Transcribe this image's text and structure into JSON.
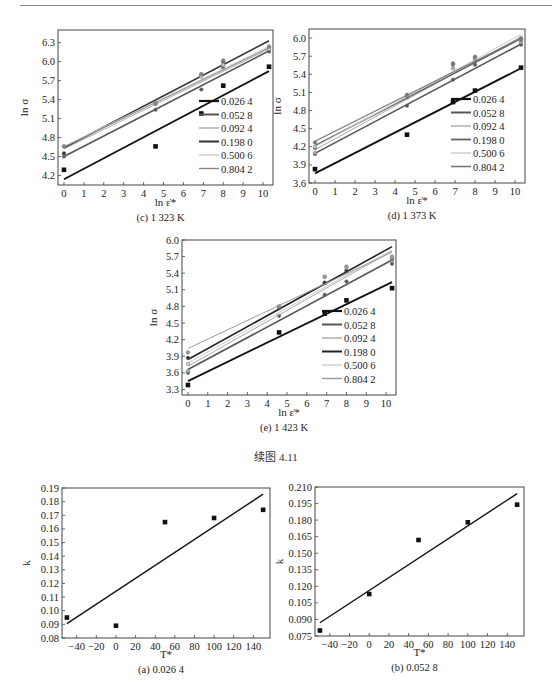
{
  "page": {
    "figure_caption": "续图 4.11"
  },
  "chart_data": [
    {
      "id": "c",
      "type": "scatter",
      "caption": "(c) 1 323 K",
      "xlabel": "ln ε̇*",
      "ylabel": "ln σ",
      "xlim": [
        -0.3,
        10.5
      ],
      "ylim": [
        4.05,
        6.5
      ],
      "xticks": [
        0,
        1,
        2,
        3,
        4,
        5,
        6,
        7,
        8,
        9,
        10
      ],
      "yticks": [
        4.2,
        4.5,
        4.8,
        5.1,
        5.4,
        5.7,
        6.0,
        6.3
      ],
      "ytick_labels": [
        "4.2",
        "4.5",
        "4.8",
        "5.1",
        "5.4",
        "5.7",
        "6.0",
        "6.3"
      ],
      "legend_position": "bottom-right",
      "x": [
        0,
        4.6,
        6.9,
        8.0,
        10.3
      ],
      "series": [
        {
          "name": "0.026 4",
          "color": "#111111",
          "width": 1.8,
          "values": [
            4.29,
            4.66,
            5.18,
            5.62,
            5.92
          ],
          "fit": [
            4.14,
            5.85
          ]
        },
        {
          "name": "0.052 8",
          "color": "#555555",
          "width": 1.6,
          "values": [
            4.5,
            5.24,
            5.56,
            5.9,
            6.16
          ],
          "fit": [
            4.5,
            6.17
          ]
        },
        {
          "name": "0.092 4",
          "color": "#aaaaaa",
          "width": 1.0,
          "values": [
            4.54,
            5.33,
            5.78,
            5.95,
            6.2
          ],
          "fit": [
            4.62,
            6.2
          ]
        },
        {
          "name": "0.198 0",
          "color": "#333333",
          "width": 1.6,
          "values": [
            4.55,
            5.34,
            5.8,
            6.0,
            6.22
          ],
          "fit": [
            4.64,
            6.33
          ]
        },
        {
          "name": "0.500 6",
          "color": "#cccccc",
          "width": 1.0,
          "values": [
            4.66,
            5.35,
            5.76,
            5.95,
            6.2
          ],
          "fit": [
            4.66,
            6.24
          ]
        },
        {
          "name": "0.804 2",
          "color": "#888888",
          "width": 1.0,
          "values": [
            4.66,
            5.34,
            5.8,
            6.02,
            6.24
          ],
          "fit": [
            4.65,
            6.22
          ]
        }
      ]
    },
    {
      "id": "d",
      "type": "scatter",
      "caption": "(d) 1 373 K",
      "xlabel": "ln ε̇*",
      "ylabel": "ln σ",
      "xlim": [
        -0.3,
        10.5
      ],
      "ylim": [
        3.6,
        6.15
      ],
      "xticks": [
        0,
        1,
        2,
        3,
        4,
        5,
        6,
        7,
        8,
        9,
        10
      ],
      "yticks": [
        3.6,
        3.9,
        4.2,
        4.5,
        4.8,
        5.1,
        5.4,
        5.7,
        6.0
      ],
      "ytick_labels": [
        "3.6",
        "3.9",
        "4.2",
        "4.5",
        "4.8",
        "5.1",
        "5.4",
        "5.7",
        "6.0"
      ],
      "legend_position": "bottom-right",
      "x": [
        0,
        4.6,
        6.9,
        8.0,
        10.3
      ],
      "series": [
        {
          "name": "0.026 4",
          "color": "#111111",
          "width": 1.8,
          "values": [
            3.83,
            4.4,
            4.94,
            5.13,
            5.51
          ],
          "fit": [
            3.76,
            5.5
          ]
        },
        {
          "name": "0.052 8",
          "color": "#555555",
          "width": 1.6,
          "values": [
            4.08,
            4.88,
            5.31,
            5.56,
            5.89
          ],
          "fit": [
            4.09,
            5.9
          ]
        },
        {
          "name": "0.092 4",
          "color": "#aaaaaa",
          "width": 1.0,
          "values": [
            4.1,
            5.02,
            5.5,
            5.62,
            5.93
          ],
          "fit": [
            4.15,
            6.02
          ]
        },
        {
          "name": "0.198 0",
          "color": "#666666",
          "width": 1.4,
          "values": [
            4.18,
            5.03,
            5.56,
            5.66,
            5.97
          ],
          "fit": [
            4.22,
            5.99
          ]
        },
        {
          "name": "0.500 6",
          "color": "#cccccc",
          "width": 1.0,
          "values": [
            4.2,
            5.05,
            5.57,
            5.68,
            6.0
          ],
          "fit": [
            4.2,
            6.06
          ]
        },
        {
          "name": "0.804 2",
          "color": "#777777",
          "width": 1.2,
          "values": [
            4.27,
            5.06,
            5.58,
            5.69,
            5.99
          ],
          "fit": [
            4.29,
            6.0
          ]
        }
      ]
    },
    {
      "id": "e",
      "type": "scatter",
      "caption": "(e) 1 423 K",
      "xlabel": "ln ε̇*",
      "ylabel": "ln σ",
      "xlim": [
        -0.3,
        10.5
      ],
      "ylim": [
        3.2,
        6.0
      ],
      "xticks": [
        0,
        1,
        2,
        3,
        4,
        5,
        6,
        7,
        8,
        9,
        10
      ],
      "yticks": [
        3.3,
        3.6,
        3.9,
        4.2,
        4.5,
        4.8,
        5.1,
        5.4,
        5.7,
        6.0
      ],
      "ytick_labels": [
        "3.3",
        "3.6",
        "3.9",
        "4.2",
        "4.5",
        "4.8",
        "5.1",
        "5.4",
        "5.7",
        "6.0"
      ],
      "legend_position": "bottom-right",
      "x": [
        0,
        4.6,
        6.9,
        8.0,
        10.3
      ],
      "series": [
        {
          "name": "0.026 4",
          "color": "#111111",
          "width": 1.8,
          "values": [
            3.38,
            4.33,
            4.67,
            4.91,
            5.13
          ],
          "fit": [
            3.45,
            5.24
          ]
        },
        {
          "name": "0.052 8",
          "color": "#555555",
          "width": 1.6,
          "values": [
            3.6,
            4.63,
            5.01,
            5.25,
            5.57
          ],
          "fit": [
            3.66,
            5.64
          ]
        },
        {
          "name": "0.092 4",
          "color": "#aaaaaa",
          "width": 1.0,
          "values": [
            3.63,
            4.77,
            5.22,
            5.43,
            5.62
          ],
          "fit": [
            3.72,
            5.8
          ]
        },
        {
          "name": "0.198 0",
          "color": "#222222",
          "width": 1.6,
          "values": [
            3.87,
            4.78,
            5.23,
            5.45,
            5.66
          ],
          "fit": [
            3.84,
            5.88
          ]
        },
        {
          "name": "0.500 6",
          "color": "#cccccc",
          "width": 1.0,
          "values": [
            3.76,
            4.8,
            5.33,
            5.5,
            5.68
          ],
          "fit": [
            3.78,
            5.82
          ]
        },
        {
          "name": "0.804 2",
          "color": "#999999",
          "width": 1.0,
          "values": [
            3.97,
            4.8,
            5.34,
            5.52,
            5.7
          ],
          "fit": [
            4.04,
            5.78
          ]
        }
      ]
    },
    {
      "id": "a",
      "type": "scatter",
      "caption": "(a) 0.026 4",
      "xlabel": "T*",
      "ylabel": "k",
      "xlim": [
        -55,
        157
      ],
      "ylim": [
        0.08,
        0.19
      ],
      "xticks": [
        -40,
        -20,
        0,
        20,
        40,
        60,
        80,
        100,
        120,
        140
      ],
      "yticks": [
        0.08,
        0.09,
        0.1,
        0.11,
        0.12,
        0.13,
        0.14,
        0.15,
        0.16,
        0.17,
        0.18,
        0.19
      ],
      "ytick_labels": [
        "0.08",
        "0.09",
        "0.10",
        "0.11",
        "0.12",
        "0.13",
        "0.14",
        "0.15",
        "0.16",
        "0.17",
        "0.18",
        "0.19"
      ],
      "x": [
        -50,
        0,
        50,
        100,
        150
      ],
      "series": [
        {
          "name": "k",
          "color": "#111111",
          "width": 1.4,
          "values": [
            0.095,
            0.089,
            0.165,
            0.168,
            0.174
          ],
          "fit_x": [
            -50,
            150
          ],
          "fit": [
            0.0905,
            0.1855
          ]
        }
      ]
    },
    {
      "id": "b",
      "type": "scatter",
      "caption": "(b) 0.052 8",
      "xlabel": "T*",
      "ylabel": "k",
      "xlim": [
        -55,
        157
      ],
      "ylim": [
        0.075,
        0.21
      ],
      "xticks": [
        -40,
        -20,
        0,
        20,
        40,
        60,
        80,
        100,
        120,
        140
      ],
      "yticks": [
        0.075,
        0.09,
        0.105,
        0.12,
        0.135,
        0.15,
        0.165,
        0.18,
        0.195,
        0.21
      ],
      "ytick_labels": [
        "0.075",
        "0.090",
        "0.105",
        "0.120",
        "0.135",
        "0.150",
        "0.165",
        "0.180",
        "0.195",
        "0.210"
      ],
      "x": [
        -50,
        0,
        50,
        100,
        150
      ],
      "series": [
        {
          "name": "k",
          "color": "#111111",
          "width": 1.4,
          "values": [
            0.08,
            0.113,
            0.162,
            0.178,
            0.194
          ],
          "fit_x": [
            -50,
            150
          ],
          "fit": [
            0.087,
            0.204
          ]
        }
      ]
    }
  ]
}
